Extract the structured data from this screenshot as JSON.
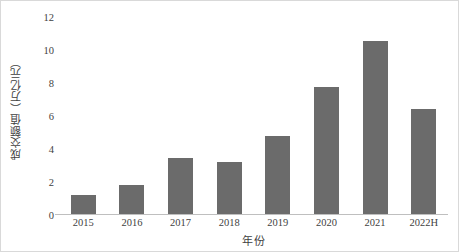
{
  "chart_data": {
    "type": "bar",
    "title": "",
    "subtitle": "",
    "xlabel": "年份",
    "ylabel": "成交额值（万亿元）",
    "categories": [
      "2015",
      "2016",
      "2017",
      "2018",
      "2019",
      "2020",
      "2021",
      "2022H"
    ],
    "values": [
      1.1,
      1.7,
      3.3,
      3.1,
      4.6,
      7.5,
      10.2,
      6.2
    ],
    "ylim": [
      0,
      12
    ],
    "ytick_values": [
      0,
      2,
      4,
      6,
      8,
      10,
      12
    ],
    "ytick_labels": [
      "0",
      "2",
      "4",
      "6",
      "8",
      "10",
      "12"
    ],
    "grid": false,
    "legend": null,
    "legend_position": "none",
    "series": [
      {
        "name": "成交额值",
        "values": [
          1.1,
          1.7,
          3.3,
          3.1,
          4.6,
          7.5,
          10.2,
          6.2
        ]
      }
    ],
    "colors": {
      "bar": "#6b6b6b",
      "axis_line": "#bfbfbf",
      "frame_border": "#d9d9d9",
      "text": "#3f3f3f",
      "background": "#ffffff"
    }
  }
}
